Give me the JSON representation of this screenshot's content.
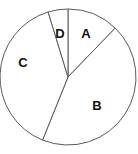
{
  "chart_data": {
    "type": "pie",
    "title": "",
    "subtitle": "",
    "xlabel": "",
    "ylabel": "",
    "legend": "none",
    "grid": false,
    "labels_inside_slices": true,
    "start_angle_deg": 0,
    "direction": "clockwise",
    "categories": [
      "A",
      "B",
      "C",
      "D"
    ],
    "values": [
      12.2,
      43.9,
      39.2,
      4.7
    ],
    "units": "percent",
    "slices": [
      {
        "label": "A",
        "value": 12.2,
        "start_angle_deg": 0,
        "end_angle_deg": 44,
        "sweep_deg": 44,
        "fill_color": "#ffffff",
        "stroke_color": "#5a5a5a"
      },
      {
        "label": "B",
        "value": 43.9,
        "start_angle_deg": 44,
        "end_angle_deg": 202,
        "sweep_deg": 158,
        "fill_color": "#ffffff",
        "stroke_color": "#5a5a5a"
      },
      {
        "label": "C",
        "value": 39.2,
        "start_angle_deg": 202,
        "end_angle_deg": 343,
        "sweep_deg": 141,
        "fill_color": "#ffffff",
        "stroke_color": "#5a5a5a"
      },
      {
        "label": "D",
        "value": 4.7,
        "start_angle_deg": 343,
        "end_angle_deg": 360,
        "sweep_deg": 17,
        "fill_color": "#ffffff",
        "stroke_color": "#5a5a5a"
      }
    ],
    "geometry": {
      "center_x": 68,
      "center_y": 77,
      "radius": 68
    },
    "label_positions": {
      "A": {
        "x": 86,
        "y": 33
      },
      "B": {
        "x": 97,
        "y": 105
      },
      "C": {
        "x": 23,
        "y": 62
      },
      "D": {
        "x": 60,
        "y": 33
      }
    },
    "colors": {
      "background": "#ffffff",
      "slice_fill": "#ffffff",
      "outline": "#5a5a5a",
      "label_text": "#111111"
    }
  }
}
